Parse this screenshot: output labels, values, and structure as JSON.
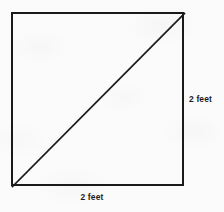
{
  "figure": {
    "type": "geometry-diagram",
    "shape": "square-with-diagonal",
    "stroke_color": "#1a1a1a",
    "background_color": "#fbfbfb"
  },
  "labels": {
    "right_side": "2 feet",
    "bottom_side": "2 feet"
  },
  "measurements": {
    "side_length_value": "2",
    "side_length_unit": "feet"
  }
}
